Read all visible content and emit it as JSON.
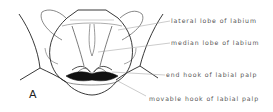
{
  "figure": {
    "panel_letter": "A",
    "subject": "labium",
    "labels": [
      {
        "id": "lateral-lobe",
        "text": "lateral lobe of labium"
      },
      {
        "id": "median-lobe",
        "text": "median lobe of labium"
      },
      {
        "id": "end-hook",
        "text": "end hook of labial palp"
      },
      {
        "id": "movable-hook",
        "text": "movable hook of labial palp"
      }
    ],
    "colors": {
      "outline": "#222222",
      "leader_line": "#999999",
      "label_text": "#555555",
      "background": "#ffffff"
    }
  }
}
